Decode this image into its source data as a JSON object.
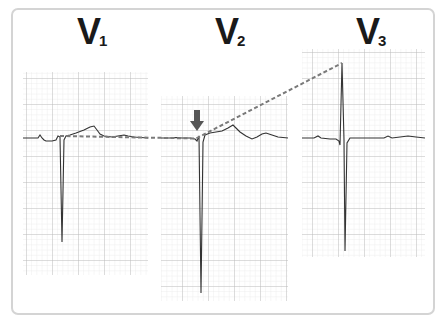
{
  "diagram": {
    "type": "ecg-precordial-leads",
    "leads": [
      {
        "id": "V1",
        "letter": "V",
        "subscript": "1",
        "grid": {
          "x": 23,
          "y": 72,
          "w": 125,
          "h": 203
        },
        "baseline_y": 138
      },
      {
        "id": "V2",
        "letter": "V",
        "subscript": "2",
        "grid": {
          "x": 161,
          "y": 96,
          "w": 127,
          "h": 205
        },
        "baseline_y": 138
      },
      {
        "id": "V3",
        "letter": "V",
        "subscript": "3",
        "grid": {
          "x": 302,
          "y": 49,
          "w": 123,
          "h": 208
        },
        "baseline_y": 138
      }
    ],
    "annotations": {
      "arrow": {
        "direction": "down",
        "color": "#555555"
      },
      "dashed_line": {
        "color": "#7a7a7a",
        "description": "ST-segment reference line across V1–V2 rising to V3 R-wave peak"
      }
    },
    "colors": {
      "grid_minor": "#e6e6e6",
      "grid_major": "#bdbdbd",
      "trace": "#333333",
      "frame_border": "#d4d4d4"
    }
  }
}
